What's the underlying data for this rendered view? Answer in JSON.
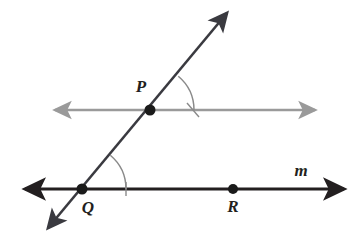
{
  "figure": {
    "background_color": "#ffffff",
    "width": 356,
    "height": 239
  },
  "colors": {
    "line_m_color": "#231f20",
    "transversal_color": "#3a3a40",
    "parallel_line_color": "#9a9a9a",
    "arc_color": "#8a8a8a",
    "point_color": "#1a1a1a",
    "label_color": "#231f20"
  },
  "labels": {
    "point_p": "P",
    "point_q": "Q",
    "point_r": "R",
    "line_m": "m"
  },
  "points": [
    {
      "name": "P",
      "label": "P",
      "x": 150,
      "y": 110,
      "radius": 5.5,
      "label_x": 141,
      "label_y": 92
    },
    {
      "name": "Q",
      "label": "Q",
      "x": 82,
      "y": 189,
      "radius": 5.5,
      "label_x": 88,
      "label_y": 213
    },
    {
      "name": "R",
      "label": "R",
      "x": 233,
      "y": 189,
      "radius": 5.0,
      "label_x": 233,
      "label_y": 212
    }
  ],
  "lines": [
    {
      "name": "line-m",
      "label": "m",
      "kind": "solid-black-double-arrow",
      "x1": 25,
      "y1": 189,
      "x2": 344,
      "y2": 189,
      "stroke": "#231f20",
      "stroke_width": 3,
      "label_x": 301,
      "label_y": 176
    },
    {
      "name": "parallel-line-upper",
      "label": "",
      "kind": "gray-double-arrow",
      "x1": 55,
      "y1": 110,
      "x2": 315,
      "y2": 110,
      "stroke": "#9a9a9a",
      "stroke_width": 2.5
    },
    {
      "name": "transversal",
      "label": "",
      "kind": "dark-double-arrow",
      "x1": 48,
      "y1": 228,
      "x2": 227,
      "y2": 13,
      "stroke": "#3a3a40",
      "stroke_width": 2.6
    }
  ],
  "angle_marks": [
    {
      "name": "angle-arc-at-p",
      "vertex": "P",
      "vertex_x": 150,
      "vertex_y": 110,
      "radius": 44,
      "from_deg": -50,
      "to_deg": 0,
      "has_tick": true,
      "tick_count": 1,
      "stroke": "#8a8a8a"
    },
    {
      "name": "angle-arc-at-q",
      "vertex": "Q",
      "vertex_x": 82,
      "vertex_y": 189,
      "radius": 44,
      "from_deg": -50,
      "to_deg": 0,
      "has_tick": true,
      "tick_count": 1,
      "stroke": "#8a8a8a"
    }
  ],
  "geometry_notes": {
    "relationship": "corresponding-angles",
    "transversal_slope_description": "rises left-to-right through Q then P"
  }
}
